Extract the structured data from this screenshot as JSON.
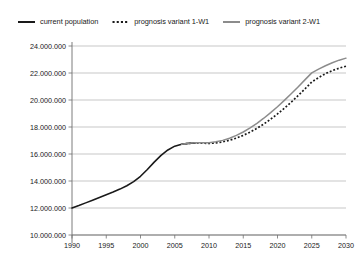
{
  "chart_data": {
    "type": "line",
    "title": "",
    "subtitle": "",
    "xlabel": "",
    "ylabel": "",
    "xlim": [
      1990,
      2030
    ],
    "ylim": [
      10000000,
      24000000
    ],
    "grid": true,
    "grid_axis": "y",
    "legend_position": "top",
    "ytick_labels": [
      "24.000.000",
      "22.000.000",
      "20.000.000",
      "18.000.000",
      "16.000.000",
      "14.000.000",
      "12.000.000",
      "10.000.000"
    ],
    "ytick_values": [
      24000000,
      22000000,
      20000000,
      18000000,
      16000000,
      14000000,
      12000000,
      10000000
    ],
    "xtick_labels": [
      "1990",
      "1995",
      "2000",
      "2005",
      "2010",
      "2015",
      "2020",
      "2025",
      "2030"
    ],
    "xtick_values": [
      1990,
      1995,
      2000,
      2005,
      2010,
      2015,
      2020,
      2025,
      2030
    ],
    "series": [
      {
        "name": "current population",
        "style": "solid",
        "color": "#1a1a1a",
        "width": 1.6,
        "x": [
          1990,
          1991,
          1992,
          1993,
          1994,
          1995,
          1996,
          1997,
          1998,
          1999,
          2000,
          2001,
          2002,
          2003,
          2004,
          2005,
          2006,
          2007,
          2008
        ],
        "values": [
          12000000,
          12180000,
          12380000,
          12580000,
          12780000,
          12980000,
          13180000,
          13400000,
          13650000,
          13950000,
          14350000,
          14850000,
          15400000,
          15900000,
          16300000,
          16580000,
          16720000,
          16790000,
          16820000
        ]
      },
      {
        "name": "prognosis variant 1-W1",
        "style": "dotted",
        "color": "#1a1a1a",
        "width": 1.7,
        "x": [
          2006,
          2007,
          2008,
          2009,
          2010,
          2011,
          2012,
          2013,
          2014,
          2015,
          2016,
          2017,
          2018,
          2019,
          2020,
          2021,
          2022,
          2023,
          2024,
          2025,
          2026,
          2027,
          2028,
          2029,
          2030
        ],
        "values": [
          16720000,
          16790000,
          16820000,
          16800000,
          16790000,
          16820000,
          16900000,
          17020000,
          17180000,
          17380000,
          17620000,
          17900000,
          18220000,
          18580000,
          18970000,
          19390000,
          19840000,
          20320000,
          20820000,
          21330000,
          21660000,
          21950000,
          22180000,
          22360000,
          22500000
        ]
      },
      {
        "name": "prognosis variant 2-W1",
        "style": "solid",
        "color": "#8c8c8c",
        "width": 1.5,
        "x": [
          2006,
          2007,
          2008,
          2009,
          2010,
          2011,
          2012,
          2013,
          2014,
          2015,
          2016,
          2017,
          2018,
          2019,
          2020,
          2021,
          2022,
          2023,
          2024,
          2025,
          2026,
          2027,
          2028,
          2029,
          2030
        ],
        "values": [
          16720000,
          16790000,
          16830000,
          16830000,
          16840000,
          16900000,
          17010000,
          17170000,
          17380000,
          17630000,
          17930000,
          18270000,
          18650000,
          19060000,
          19500000,
          19970000,
          20460000,
          20970000,
          21490000,
          22010000,
          22290000,
          22540000,
          22760000,
          22950000,
          23100000
        ]
      }
    ]
  },
  "legend": {
    "items": [
      {
        "label": "current population",
        "marker": "solid-line-black",
        "color": "#1a1a1a"
      },
      {
        "label": "prognosis variant 1-W1",
        "marker": "dotted-line-black",
        "color": "#1a1a1a"
      },
      {
        "label": "prognosis variant 2-W1",
        "marker": "solid-line-gray",
        "color": "#8c8c8c"
      }
    ]
  },
  "axes": {
    "gridline_color": "#b0b0b0",
    "axis_color": "#6e6e6e"
  }
}
